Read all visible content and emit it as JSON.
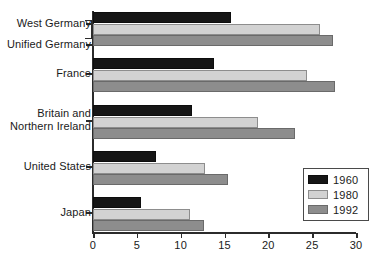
{
  "chart_data": {
    "type": "bar",
    "orientation": "horizontal",
    "title": "",
    "xlabel": "",
    "ylabel": "",
    "xlim": [
      0,
      30
    ],
    "xticks": [
      0,
      5,
      10,
      15,
      20,
      25,
      30
    ],
    "xtick_labels": [
      "0",
      "5",
      "10",
      "15",
      "20",
      "25",
      "30"
    ],
    "grid": false,
    "legend_position": "bottom-right",
    "categories": [
      "West Germany / Unified Germany",
      "France",
      "Britain and Northern Ireland",
      "United States",
      "Japan"
    ],
    "category_labels": [
      [
        "West Germany",
        "Unified Germany"
      ],
      [
        "France"
      ],
      [
        "Britain and",
        "Northern Ireland"
      ],
      [
        "United States"
      ],
      [
        "Japan"
      ]
    ],
    "series": [
      {
        "name": "1960",
        "color": "#161616",
        "values": [
          15.7,
          13.8,
          11.3,
          7.2,
          5.5
        ]
      },
      {
        "name": "1980",
        "color": "#d2d2d2",
        "values": [
          25.9,
          24.4,
          18.8,
          12.8,
          11.1
        ]
      },
      {
        "name": "1992",
        "color": "#8d8d8d",
        "values": [
          27.4,
          27.6,
          23.0,
          15.4,
          12.7
        ]
      }
    ]
  },
  "legend": {
    "entries": [
      {
        "label": "1960"
      },
      {
        "label": "1980"
      },
      {
        "label": "1992"
      }
    ]
  },
  "axis": {
    "tick_labels": [
      "0",
      "5",
      "10",
      "15",
      "20",
      "25",
      "30"
    ]
  },
  "labels": {
    "west_germany": "West Germany",
    "unified_germany": "Unified Germany",
    "france": "France",
    "britain_line1": "Britain and",
    "britain_line2": "Northern Ireland",
    "united_states": "United States",
    "japan": "Japan"
  }
}
